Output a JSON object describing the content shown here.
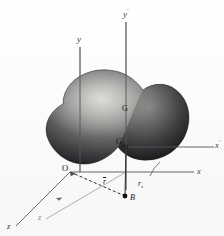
{
  "figure": {
    "caption_strip": "Fig. 1   Rigid body with body axes and space axes",
    "background_color": "#fdfdfd",
    "ink_color": "#3a3a3a",
    "body_fill_dark": "#1d1d20",
    "body_fill_light": "#d8d8d6"
  },
  "axes": [
    {
      "id": "y",
      "label": "y",
      "prime": false,
      "origin": "O",
      "direction": "up",
      "tip": [
        80,
        42
      ]
    },
    {
      "id": "y-prime",
      "label": "y",
      "prime": true,
      "origin": "G",
      "direction": "up",
      "tip": [
        126,
        17
      ]
    },
    {
      "id": "x",
      "label": "x",
      "prime": false,
      "origin": "O",
      "direction": "right",
      "tip": [
        198,
        175
      ]
    },
    {
      "id": "x-prime",
      "label": "x",
      "prime": true,
      "origin": "G",
      "direction": "right",
      "tip": [
        218,
        152
      ]
    },
    {
      "id": "z",
      "label": "z",
      "prime": false,
      "origin": "O",
      "direction": "lower-left",
      "tip": [
        12,
        229
      ]
    },
    {
      "id": "z-prime",
      "label": "z",
      "prime": true,
      "origin": "G",
      "direction": "lower-left",
      "tip": [
        42,
        224
      ]
    }
  ],
  "points": [
    {
      "id": "origin-O",
      "label": "O",
      "subscript": "",
      "x": 70,
      "y": 172,
      "note": "origin of space frame"
    },
    {
      "id": "centre-of-mass-G",
      "label": "G",
      "subscript": "0",
      "x": 107,
      "y": 147,
      "note": "centre of mass / body frame origin"
    },
    {
      "id": "point-G-body",
      "label": "G",
      "subscript": "",
      "x": 131,
      "y": 122,
      "note": "label marked on the body surface"
    },
    {
      "id": "mass-point-B",
      "label": "B",
      "subscript": "",
      "x": 121,
      "y": 198,
      "note": "representative mass element"
    }
  ],
  "vectors": [
    {
      "id": "vector-r-bar",
      "label": "r",
      "overbar": true,
      "from": "O",
      "to": "B",
      "style": "dashed"
    },
    {
      "id": "vector-r-sub",
      "label": "r",
      "subscript": "c",
      "from": "G",
      "to": "B",
      "style": "solid"
    }
  ],
  "labels": {
    "y": "y",
    "y_prime": "y",
    "x": "x",
    "x_prime": "x",
    "z": "z",
    "z_prime": "z",
    "prime_mark": "′",
    "O": "O",
    "G": "G",
    "G_sub": "0",
    "B": "B",
    "r_bar": "r",
    "r_c": "r"
  }
}
